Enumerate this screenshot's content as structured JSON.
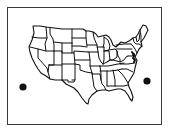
{
  "figure": {
    "type": "outline-map",
    "colors": {
      "background": "#ffffff",
      "outline": "#111111",
      "frame": "#3a3a3a",
      "dot": "#111111"
    }
  },
  "markers": [
    {
      "name": "left-dot",
      "cx": 23,
      "cy": 87,
      "r": 3.6
    },
    {
      "name": "right-dot",
      "cx": 147,
      "cy": 81,
      "r": 3.6
    }
  ]
}
